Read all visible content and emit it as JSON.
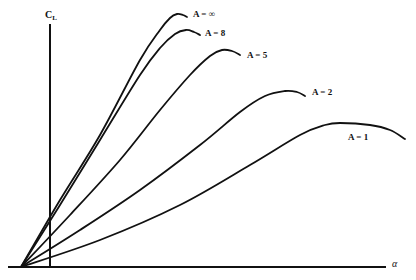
{
  "chart_data": {
    "type": "line",
    "title": "",
    "xlabel": "α",
    "ylabel": "C_L",
    "ylabel_main": "C",
    "ylabel_sub": "L",
    "grid": false,
    "legend": "inline labels at curve ends",
    "origin_px": [
      21,
      267
    ],
    "y_axis_x_px": 50,
    "x_axis_end_px": 386,
    "series": [
      {
        "name": "A = ∞",
        "label": "A = ∞",
        "points_px": [
          [
            21,
            267
          ],
          [
            60,
            200
          ],
          [
            100,
            135
          ],
          [
            140,
            60
          ],
          [
            160,
            30
          ],
          [
            170,
            18
          ],
          [
            177,
            14
          ],
          [
            183,
            15
          ],
          [
            187,
            17
          ]
        ],
        "label_pos": [
          193,
          10
        ]
      },
      {
        "name": "A = 8",
        "label": "A = 8",
        "points_px": [
          [
            21,
            267
          ],
          [
            60,
            205
          ],
          [
            100,
            140
          ],
          [
            140,
            75
          ],
          [
            160,
            48
          ],
          [
            175,
            34
          ],
          [
            186,
            30
          ],
          [
            194,
            32
          ],
          [
            200,
            35
          ]
        ],
        "label_pos": [
          205,
          29
        ]
      },
      {
        "name": "A = 5",
        "label": "A = 5",
        "points_px": [
          [
            21,
            267
          ],
          [
            70,
            215
          ],
          [
            120,
            160
          ],
          [
            160,
            110
          ],
          [
            190,
            75
          ],
          [
            210,
            56
          ],
          [
            222,
            50
          ],
          [
            232,
            51
          ],
          [
            240,
            55
          ]
        ],
        "label_pos": [
          247,
          51
        ]
      },
      {
        "name": "A = 2",
        "label": "A = 2",
        "points_px": [
          [
            21,
            267
          ],
          [
            80,
            230
          ],
          [
            140,
            190
          ],
          [
            200,
            145
          ],
          [
            240,
            112
          ],
          [
            265,
            96
          ],
          [
            285,
            91
          ],
          [
            297,
            92
          ],
          [
            305,
            96
          ]
        ],
        "label_pos": [
          312,
          88
        ]
      },
      {
        "name": "A = 1",
        "label": "A = 1",
        "points_px": [
          [
            21,
            267
          ],
          [
            100,
            240
          ],
          [
            180,
            205
          ],
          [
            250,
            165
          ],
          [
            300,
            135
          ],
          [
            325,
            125
          ],
          [
            340,
            123
          ],
          [
            370,
            125
          ],
          [
            390,
            130
          ],
          [
            405,
            139
          ]
        ],
        "label_pos": [
          348,
          133
        ]
      }
    ]
  }
}
